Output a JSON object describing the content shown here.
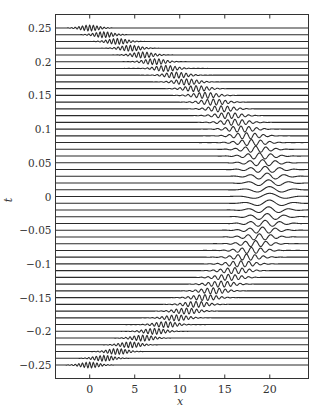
{
  "chart_data": {
    "type": "line",
    "title": "",
    "xlabel": "x",
    "ylabel": "t",
    "xlim": [
      -3.8,
      24.3
    ],
    "ylim": [
      -0.27,
      0.27
    ],
    "xticks": [
      0,
      5,
      10,
      15,
      20
    ],
    "xtick_labels": [
      "0",
      "5",
      "10",
      "15",
      "20"
    ],
    "yticks": [
      0.25,
      0.2,
      0.15,
      0.1,
      0.05,
      0,
      -0.05,
      -0.1,
      -0.15,
      -0.2,
      -0.25
    ],
    "ytick_labels": [
      "0.25",
      "0.2",
      "0.15",
      "0.1",
      "0.05",
      "0",
      "-0.05",
      "-0.1",
      "-0.15",
      "-0.2",
      "-0.25"
    ],
    "grid": false,
    "legend": null,
    "series": {
      "t_values_start": 0.25,
      "t_values_end": -0.25,
      "t_step": -0.01,
      "num_traces": 51,
      "center_model": "x_c(t) = 20 - 320*t^2",
      "center_samples": [
        {
          "t": 0.25,
          "x_center": 0
        },
        {
          "t": 0.2,
          "x_center": 7.2
        },
        {
          "t": 0.15,
          "x_center": 12.8
        },
        {
          "t": 0.1,
          "x_center": 16.8
        },
        {
          "t": 0.05,
          "x_center": 19.2
        },
        {
          "t": 0,
          "x_center": 20
        },
        {
          "t": -0.05,
          "x_center": 19.2
        },
        {
          "t": -0.1,
          "x_center": 16.8
        },
        {
          "t": -0.15,
          "x_center": 12.8
        },
        {
          "t": -0.2,
          "x_center": 7.2
        },
        {
          "t": -0.25,
          "x_center": 0
        }
      ]
    }
  },
  "axes": {
    "xlabel": "x",
    "ylabel": "t"
  }
}
